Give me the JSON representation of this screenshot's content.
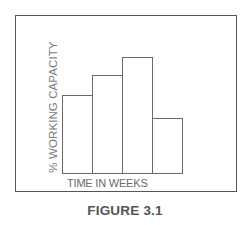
{
  "figure": {
    "caption": "FIGURE 3.1",
    "border_color": "#555555"
  },
  "chart_data": {
    "type": "bar",
    "title": "",
    "caption": "FIGURE 3.1",
    "xlabel": "TIME IN WEEKS",
    "ylabel": "% WORKING CAPACITY",
    "categories": [
      "1",
      "2",
      "3",
      "4"
    ],
    "values": [
      78,
      98,
      116,
      55
    ],
    "value_units": "relative (no numeric axis shown)",
    "ylim": [
      0,
      130
    ],
    "grid": false,
    "legend": "none",
    "bar_fill": "#ffffff",
    "bar_outline": "#6a6a6a",
    "tick_labels_visible": false
  },
  "layout": {
    "baseline_y": 173,
    "bar_left_start": 62,
    "bar_width": 30
  }
}
